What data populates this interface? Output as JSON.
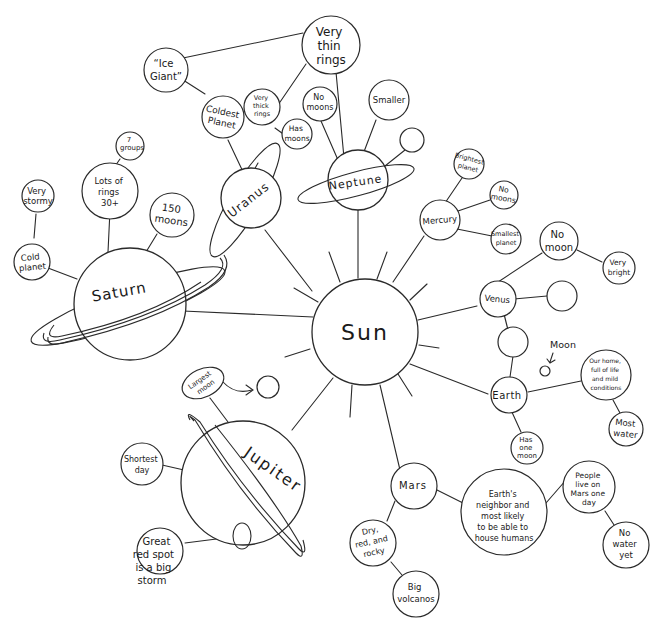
{
  "diagram": {
    "type": "hand-drawn mind map",
    "center": {
      "id": "sun",
      "label": "Sun"
    },
    "planets": [
      {
        "id": "mercury",
        "label": "Mercury",
        "facts": [
          "Brightest planet",
          "No moons",
          "Smallest planet"
        ]
      },
      {
        "id": "venus",
        "label": "Venus",
        "facts": [
          "No moon",
          "Very bright"
        ]
      },
      {
        "id": "earth",
        "label": "Earth",
        "facts": [
          "Our home, full of life and mild conditions",
          "Most water",
          "Has one moon"
        ],
        "moon_label": "Moon"
      },
      {
        "id": "mars",
        "label": "Mars",
        "facts": [
          "Earth's neighbor and most likely to be able to house humans",
          "People live on Mars one day",
          "No water yet",
          "Dry, red, and rocky",
          "Big volcanos"
        ]
      },
      {
        "id": "jupiter",
        "label": "Jupiter",
        "facts": [
          "Largest moon",
          "Shortest day",
          "Great red spot is a big storm"
        ]
      },
      {
        "id": "saturn",
        "label": "Saturn",
        "facts": [
          "Cold planet",
          "Very stormy",
          "Lots of rings 30+",
          "7 groups",
          "150 moons"
        ]
      },
      {
        "id": "uranus",
        "label": "Uranus",
        "facts": [
          "Coldest Planet",
          "\"Ice Giant\"",
          "Very thick rings",
          "Has moons"
        ]
      },
      {
        "id": "neptune",
        "label": "Neptune",
        "facts": [
          "Very thin rings",
          "No moons",
          "Smaller"
        ]
      }
    ]
  },
  "labels": {
    "sun": "Sun",
    "mercury": "Mercury",
    "brightest_1": "Brightest",
    "brightest_2": "planet",
    "mercury_nomoons_1": "No",
    "mercury_nomoons_2": "moons",
    "smallest_1": "Smallest",
    "smallest_2": "planet",
    "venus": "Venus",
    "nomoon_1": "No",
    "nomoon_2": "moon",
    "verybright_1": "Very",
    "verybright_2": "bright",
    "earth": "Earth",
    "moon": "Moon",
    "home_1": "Our home,",
    "home_2": "full of life",
    "home_3": "and mild",
    "home_4": "conditions",
    "mostwater_1": "Most",
    "mostwater_2": "water",
    "onemoon_1": "Has",
    "onemoon_2": "one",
    "onemoon_3": "moon",
    "mars": "Mars",
    "neighbor_1": "Earth's",
    "neighbor_2": "neighbor and",
    "neighbor_3": "most likely",
    "neighbor_4": "to be able to",
    "neighbor_5": "house humans",
    "people_1": "People",
    "people_2": "live on",
    "people_3": "Mars one",
    "people_4": "day",
    "nowater_1": "No",
    "nowater_2": "water",
    "nowater_3": "yet",
    "dry_1": "Dry,",
    "dry_2": "red, and",
    "dry_3": "rocky",
    "volcano_1": "Big",
    "volcano_2": "volcanos",
    "jupiter": "Jupiter",
    "largest_1": "Largest",
    "largest_2": "moon",
    "shortest_1": "Shortest",
    "shortest_2": "day",
    "spot_1": "Great",
    "spot_2": "red spot",
    "spot_3": "is a big",
    "spot_4": "storm",
    "saturn": "Saturn",
    "cold_1": "Cold",
    "cold_2": "planet",
    "stormy_1": "Very",
    "stormy_2": "stormy",
    "rings_1": "Lots of",
    "rings_2": "rings",
    "rings_3": "30+",
    "groups_1": "7",
    "groups_2": "groups",
    "moons150_1": "150",
    "moons150_2": "moons",
    "uranus": "Uranus",
    "coldest_1": "Coldest",
    "coldest_2": "Planet",
    "icegiant_1": "“Ice",
    "icegiant_2": "Giant”",
    "thick_1": "Very",
    "thick_2": "thick",
    "thick_3": "rings",
    "hasmoons_1": "Has",
    "hasmoons_2": "moons",
    "neptune": "Neptune",
    "thin_1": "Very",
    "thin_2": "thin",
    "thin_3": "rings",
    "nep_nomoons_1": "No",
    "nep_nomoons_2": "moons",
    "smaller": "Smaller"
  }
}
